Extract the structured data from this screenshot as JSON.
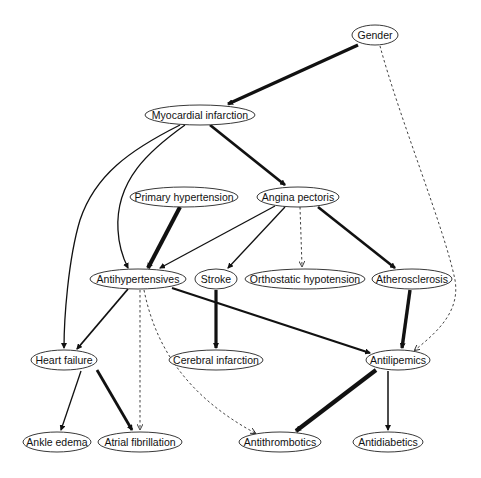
{
  "diagram": {
    "type": "directed-graph",
    "nodes": [
      {
        "id": "gender",
        "label": "Gender",
        "x": 375,
        "y": 35,
        "rx": 23
      },
      {
        "id": "mi",
        "label": "Myocardial infarction",
        "x": 200,
        "y": 115,
        "rx": 55
      },
      {
        "id": "ph",
        "label": "Primary hypertension",
        "x": 184,
        "y": 197,
        "rx": 54
      },
      {
        "id": "ap",
        "label": "Angina pectoris",
        "x": 298,
        "y": 197,
        "rx": 41
      },
      {
        "id": "ahyp",
        "label": "Antihypertensives",
        "x": 138,
        "y": 279,
        "rx": 48
      },
      {
        "id": "stroke",
        "label": "Stroke",
        "x": 216,
        "y": 279,
        "rx": 21
      },
      {
        "id": "oh",
        "label": "Orthostatic hypotension",
        "x": 305,
        "y": 279,
        "rx": 60
      },
      {
        "id": "ath",
        "label": "Atherosclerosis",
        "x": 412,
        "y": 279,
        "rx": 40
      },
      {
        "id": "hf",
        "label": "Heart failure",
        "x": 64,
        "y": 360,
        "rx": 33
      },
      {
        "id": "ci",
        "label": "Cerebral infarction",
        "x": 216,
        "y": 360,
        "rx": 47
      },
      {
        "id": "alip",
        "label": "Antilipemics",
        "x": 398,
        "y": 360,
        "rx": 32
      },
      {
        "id": "ae",
        "label": "Ankle edema",
        "x": 57,
        "y": 442,
        "rx": 34
      },
      {
        "id": "af",
        "label": "Atrial fibrillation",
        "x": 140,
        "y": 442,
        "rx": 42
      },
      {
        "id": "athr",
        "label": "Antithrombotics",
        "x": 280,
        "y": 442,
        "rx": 41
      },
      {
        "id": "adia",
        "label": "Antidiabetics",
        "x": 388,
        "y": 442,
        "rx": 35
      }
    ],
    "edges": [
      {
        "from": "gender",
        "to": "mi",
        "weight": "thick",
        "style": "solid"
      },
      {
        "from": "gender",
        "to": "alip",
        "weight": "thin",
        "style": "dashed"
      },
      {
        "from": "mi",
        "to": "ap",
        "weight": "thick",
        "style": "solid"
      },
      {
        "from": "mi",
        "to": "ahyp",
        "weight": "medium",
        "style": "solid"
      },
      {
        "from": "mi",
        "to": "hf",
        "weight": "medium",
        "style": "solid"
      },
      {
        "from": "ph",
        "to": "ahyp",
        "weight": "thick",
        "style": "solid"
      },
      {
        "from": "ap",
        "to": "ahyp",
        "weight": "medium",
        "style": "solid"
      },
      {
        "from": "ap",
        "to": "stroke",
        "weight": "medium",
        "style": "solid"
      },
      {
        "from": "ap",
        "to": "oh",
        "weight": "thin",
        "style": "dashed"
      },
      {
        "from": "ap",
        "to": "ath",
        "weight": "thick",
        "style": "solid"
      },
      {
        "from": "ahyp",
        "to": "hf",
        "weight": "medium",
        "style": "solid"
      },
      {
        "from": "ahyp",
        "to": "alip",
        "weight": "thick",
        "style": "solid"
      },
      {
        "from": "ahyp",
        "to": "af",
        "weight": "thin",
        "style": "dashed"
      },
      {
        "from": "ahyp",
        "to": "athr",
        "weight": "thin",
        "style": "dashed"
      },
      {
        "from": "stroke",
        "to": "ci",
        "weight": "thick",
        "style": "solid"
      },
      {
        "from": "ath",
        "to": "alip",
        "weight": "thick",
        "style": "solid"
      },
      {
        "from": "hf",
        "to": "ae",
        "weight": "medium",
        "style": "solid"
      },
      {
        "from": "hf",
        "to": "af",
        "weight": "thick",
        "style": "solid"
      },
      {
        "from": "alip",
        "to": "athr",
        "weight": "thick",
        "style": "solid"
      },
      {
        "from": "alip",
        "to": "adia",
        "weight": "medium",
        "style": "solid"
      }
    ],
    "colors": {
      "stroke": "#111111",
      "node_fill": "#ffffff",
      "background": "#ffffff"
    }
  }
}
